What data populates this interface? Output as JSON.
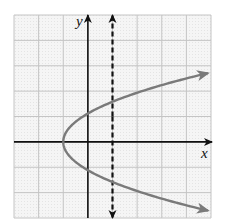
{
  "chart_data": {
    "type": "line",
    "title": "",
    "xlabel": "x",
    "ylabel": "y",
    "xlim": [
      -3,
      5
    ],
    "ylim": [
      -3,
      5
    ],
    "grid": true,
    "grid_step": 1,
    "legend": null,
    "series": [
      {
        "name": "parabola",
        "equation": "x = 0.8y^2 - 1",
        "style": "solid",
        "color": "#7a7a7a",
        "arrows": "both-ends",
        "points": [
          {
            "x": 4.9,
            "y": -2.71
          },
          {
            "x": 4,
            "y": -2.5
          },
          {
            "x": 3,
            "y": -2.24
          },
          {
            "x": 2,
            "y": -1.94
          },
          {
            "x": 1,
            "y": -1.58
          },
          {
            "x": 0,
            "y": -1.12
          },
          {
            "x": -0.2,
            "y": -1
          },
          {
            "x": -1,
            "y": 0
          },
          {
            "x": -0.2,
            "y": 1
          },
          {
            "x": 0,
            "y": 1.12
          },
          {
            "x": 1,
            "y": 1.58
          },
          {
            "x": 2,
            "y": 1.94
          },
          {
            "x": 3,
            "y": 2.24
          },
          {
            "x": 4,
            "y": 2.5
          },
          {
            "x": 4.9,
            "y": 2.71
          }
        ]
      },
      {
        "name": "vertical-line",
        "equation": "x = 1",
        "style": "dashed",
        "color": "#111111",
        "arrows": "both-ends",
        "points": [
          {
            "x": 1,
            "y": -3
          },
          {
            "x": 1,
            "y": 5
          }
        ]
      }
    ],
    "annotations": [
      "x",
      "y"
    ]
  },
  "colors": {
    "background": "#f3f3f3",
    "grid": "#c4c4c4",
    "axes": "#111111",
    "curve": "#7a7a7a"
  },
  "labels": {
    "x_axis": "x",
    "y_axis": "y"
  }
}
